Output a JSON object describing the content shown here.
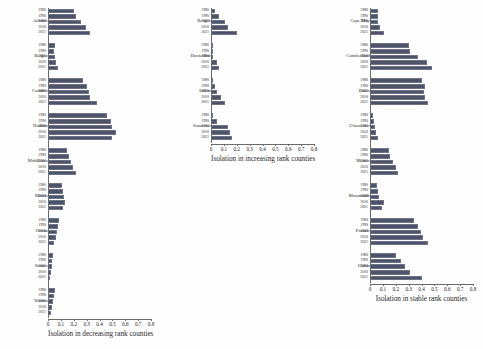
{
  "figure": {
    "bar_color": "#4d5369",
    "axis_color": "#6b6b6b",
    "background": "#fefefe"
  },
  "chart_data": {
    "type": "bar",
    "title": "",
    "orientation": "horizontal",
    "grid": false,
    "legend": null,
    "xlim": [
      0,
      0.8
    ],
    "xticks": [
      0,
      0.1,
      0.2,
      0.3,
      0.4,
      0.5,
      0.6,
      0.7,
      0.8
    ],
    "xtick_labels": [
      "0",
      "0.1",
      "0.2",
      "0.3",
      "0.4",
      "0.5",
      "0.6",
      "0.7",
      "0.8"
    ],
    "ylabel": "",
    "categories": [
      "1980",
      "1990",
      "2000",
      "2010",
      "2021"
    ],
    "panels": [
      {
        "xlabel": "Isolation in decreasing rank counties",
        "groups": [
          {
            "name": "Atlantic",
            "values": [
              0.205,
              0.215,
              0.255,
              0.295,
              0.33
            ]
          },
          {
            "name": "Bergen",
            "values": [
              0.055,
              0.05,
              0.052,
              0.062,
              0.08
            ]
          },
          {
            "name": "Camden",
            "values": [
              0.27,
              0.3,
              0.315,
              0.33,
              0.38
            ]
          },
          {
            "name": "Hudson",
            "values": [
              0.46,
              0.49,
              0.5,
              0.53,
              0.5
            ]
          },
          {
            "name": "Middlesex",
            "values": [
              0.15,
              0.16,
              0.175,
              0.195,
              0.215
            ]
          },
          {
            "name": "Morris",
            "values": [
              0.11,
              0.12,
              0.125,
              0.13,
              0.12
            ]
          },
          {
            "name": "Ocean",
            "values": [
              0.085,
              0.075,
              0.07,
              0.06,
              0.05
            ]
          },
          {
            "name": "Sussex",
            "values": [
              0.04,
              0.032,
              0.028,
              0.022,
              0.018
            ]
          },
          {
            "name": "Warren",
            "values": [
              0.055,
              0.045,
              0.038,
              0.03,
              0.025
            ]
          }
        ]
      },
      {
        "xlabel": "Isolation in increasing rank counties",
        "groups": [
          {
            "name": "Bergen",
            "values": [
              0.03,
              0.06,
              0.11,
              0.135,
              0.2
            ]
          },
          {
            "name": "Hunterdon",
            "values": [
              0.004,
              0.008,
              0.016,
              0.046,
              0.065
            ]
          },
          {
            "name": "Salem",
            "values": [
              0.01,
              0.03,
              0.05,
              0.075,
              0.11
            ]
          },
          {
            "name": "Somerset",
            "values": [
              0.015,
              0.045,
              0.13,
              0.15,
              0.165
            ]
          }
        ]
      },
      {
        "xlabel": "Isolation in stable rank counties",
        "groups": [
          {
            "name": "Cape May",
            "values": [
              0.06,
              0.062,
              0.065,
              0.075,
              0.11
            ]
          },
          {
            "name": "Cumberland",
            "values": [
              0.3,
              0.31,
              0.37,
              0.44,
              0.48
            ]
          },
          {
            "name": "Essex",
            "values": [
              0.4,
              0.43,
              0.42,
              0.43,
              0.45
            ]
          },
          {
            "name": "Gloucester",
            "values": [
              0.02,
              0.03,
              0.04,
              0.05,
              0.065
            ]
          },
          {
            "name": "Mercer",
            "values": [
              0.145,
              0.155,
              0.175,
              0.2,
              0.215
            ]
          },
          {
            "name": "Monmouth",
            "values": [
              0.055,
              0.06,
              0.07,
              0.11,
              0.09
            ]
          },
          {
            "name": "Passaic",
            "values": [
              0.345,
              0.37,
              0.395,
              0.415,
              0.45
            ]
          },
          {
            "name": "Union",
            "values": [
              0.2,
              0.24,
              0.27,
              0.31,
              0.4
            ]
          }
        ]
      }
    ]
  }
}
